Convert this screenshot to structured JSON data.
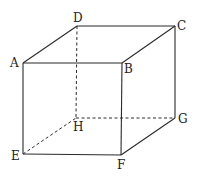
{
  "diagram": {
    "vertices": {
      "A": {
        "label": "A",
        "x": 23,
        "y": 63
      },
      "B": {
        "label": "B",
        "x": 122,
        "y": 63
      },
      "C": {
        "label": "C",
        "x": 175,
        "y": 26
      },
      "D": {
        "label": "D",
        "x": 77,
        "y": 26
      },
      "E": {
        "label": "E",
        "x": 23,
        "y": 154
      },
      "F": {
        "label": "F",
        "x": 121,
        "y": 155
      },
      "G": {
        "label": "G",
        "x": 175,
        "y": 118
      },
      "H": {
        "label": "H",
        "x": 76,
        "y": 118
      }
    },
    "visible_edges": [
      "AB",
      "BC",
      "CD",
      "DA",
      "AE",
      "BF",
      "CG",
      "EF",
      "FG"
    ],
    "hidden_edges": [
      "DH",
      "EH",
      "HG"
    ],
    "colors": {
      "line": "#2a2a2a",
      "text": "#222222",
      "background": "#ffffff"
    }
  }
}
